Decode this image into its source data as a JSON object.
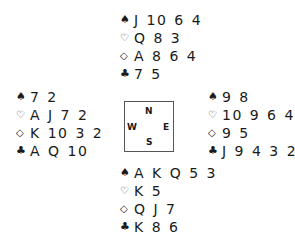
{
  "diagram": {
    "type": "bridge-deal",
    "compass": {
      "north": "N",
      "south": "S",
      "east": "E",
      "west": "W"
    },
    "suit_symbols": {
      "spades": "♠",
      "hearts": "♡",
      "diamonds": "◇",
      "clubs": "♣"
    },
    "hands": {
      "north": {
        "spades": "J 10 6 4",
        "hearts": "Q 8 3",
        "diamonds": "A 8 6 4",
        "clubs": "7 5"
      },
      "west": {
        "spades": "7 2",
        "hearts": "A J 7 2",
        "diamonds": "K 10 3 2",
        "clubs": "A Q 10"
      },
      "east": {
        "spades": "9 8",
        "hearts": "10 9 6 4",
        "diamonds": "9 5",
        "clubs": "J 9 4 3 2"
      },
      "south": {
        "spades": "A K Q 5 3",
        "hearts": "K 5",
        "diamonds": "Q J 7",
        "clubs": "K 8 6"
      }
    }
  }
}
